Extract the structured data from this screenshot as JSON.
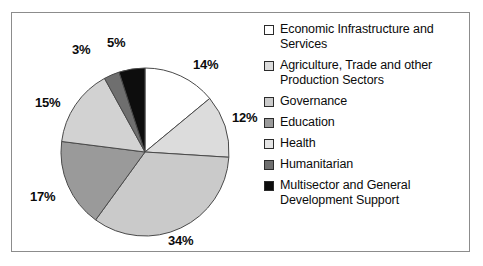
{
  "chart_data": {
    "type": "pie",
    "title": "",
    "legend_position": "right",
    "categories": [
      "Economic Infrastructure and Services",
      "Agriculture, Trade and other Production Sectors",
      "Governance",
      "Education",
      "Health",
      "Humanitarian",
      "Multisector and General Development Support"
    ],
    "values": [
      14,
      12,
      34,
      17,
      15,
      3,
      5
    ],
    "value_labels": [
      "14%",
      "12%",
      "34%",
      "17%",
      "15%",
      "3%",
      "5%"
    ],
    "colors": [
      "#ffffff",
      "#dcdcdc",
      "#cacaca",
      "#9a9a9a",
      "#d2d2d2",
      "#6f6f6f",
      "#0d0d0d"
    ],
    "slice_outline_color": "#4a4a4a",
    "start_angle_deg": 0,
    "direction": "clockwise"
  },
  "frame": {
    "border_color": "#8c8c8c",
    "background": "#ffffff"
  },
  "labels": [
    {
      "text": "14%",
      "x": 181,
      "y": 44
    },
    {
      "text": "12%",
      "x": 220,
      "y": 97
    },
    {
      "text": "34%",
      "x": 156,
      "y": 220
    },
    {
      "text": "17%",
      "x": 18,
      "y": 176
    },
    {
      "text": "15%",
      "x": 23,
      "y": 82
    },
    {
      "text": "3%",
      "x": 60,
      "y": 29
    },
    {
      "text": "5%",
      "x": 95,
      "y": 22
    }
  ],
  "legend": {
    "items": [
      {
        "label": "Economic Infrastructure and Services",
        "color": "#ffffff"
      },
      {
        "label": "Agriculture, Trade and other Production Sectors",
        "color": "#dcdcdc"
      },
      {
        "label": "Governance",
        "color": "#cacaca"
      },
      {
        "label": "Education",
        "color": "#9a9a9a"
      },
      {
        "label": "Health",
        "color": "#e4e4e4"
      },
      {
        "label": "Humanitarian",
        "color": "#6f6f6f"
      },
      {
        "label": "Multisector and General Development Support",
        "color": "#0d0d0d"
      }
    ]
  }
}
